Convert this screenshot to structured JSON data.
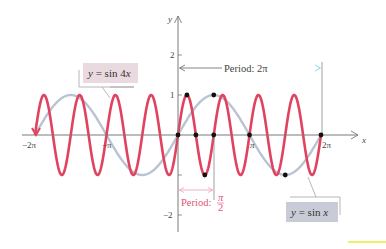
{
  "chart_data": {
    "type": "line",
    "title": "",
    "xlabel": "x",
    "ylabel": "y",
    "xlim": [
      -6.2832,
      6.2832
    ],
    "ylim": [
      -2.2,
      2.6
    ],
    "x_ticks": [
      "−2π",
      "−π",
      "π",
      "2π"
    ],
    "y_ticks": [
      "2",
      "1",
      "−2"
    ],
    "grid": false,
    "series": [
      {
        "name": "y = sin x",
        "function": "sin(x)",
        "color": "#b9c3d3",
        "domain": [
          -6.2832,
          6.2832
        ],
        "period": "2π"
      },
      {
        "name": "y = sin 4x",
        "function": "sin(4x)",
        "color": "#e0425f",
        "domain": [
          -6.2832,
          6.2832
        ],
        "period": "π/2"
      }
    ],
    "marked_points": [
      {
        "x": 0,
        "y": 0
      },
      {
        "x": 0.3927,
        "y": 1
      },
      {
        "x": 0.7854,
        "y": 0
      },
      {
        "x": 1.1781,
        "y": -1
      },
      {
        "x": 1.5708,
        "y": 0
      },
      {
        "x": 1.5708,
        "y": 1
      },
      {
        "x": 3.1416,
        "y": 0
      },
      {
        "x": 4.7124,
        "y": -1
      },
      {
        "x": 6.2832,
        "y": 0
      }
    ],
    "annotations": [
      {
        "text": "y = sin 4x",
        "type": "label-box"
      },
      {
        "text": "y = sin x",
        "type": "label-box"
      },
      {
        "text": "Period: 2π",
        "type": "span-arrow",
        "from": 0,
        "to": 6.2832
      },
      {
        "text": "Period: π/2",
        "type": "span-arrow",
        "from": 0,
        "to": 1.5708
      }
    ]
  },
  "labels": {
    "x_axis": "x",
    "y_axis": "y",
    "tick_neg2pi": "−2π",
    "tick_negpi": "−π",
    "tick_pi": "π",
    "tick_2pi": "2π",
    "tick_y2": "2",
    "tick_y1": "1",
    "tick_yneg2": "−2",
    "sin4x_label": "y = sin 4x",
    "sinx_label": "y = sin x",
    "period_2pi": "Period:  2π",
    "period_pi2_prefix": "Period:",
    "period_pi2_num": "π",
    "period_pi2_den": "2"
  },
  "colors": {
    "sin4x": "#e0425f",
    "sinx": "#b9c3d3",
    "axis": "#777777",
    "sin4x_box": "#ead9df",
    "sinx_box": "#c9ccd7",
    "period_pink": "#e05577",
    "period_arrow_teal": "#86d8d8",
    "highlight_yellow": "#eef06a"
  }
}
